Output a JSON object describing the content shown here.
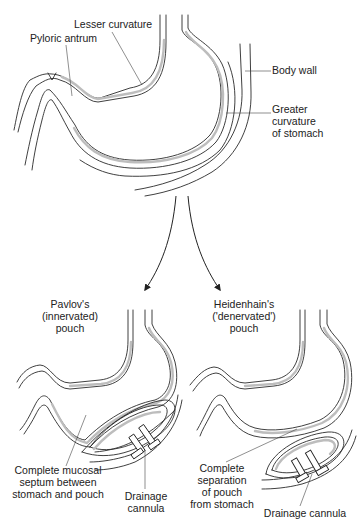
{
  "figure": {
    "top": {
      "labels": {
        "lesser_curvature": "Lesser curvature",
        "pyloric_antrum": "Pyloric antrum",
        "body_wall": "Body wall",
        "greater_curvature": [
          "Greater",
          "curvature",
          "of stomach"
        ]
      }
    },
    "pavlov": {
      "title": [
        "Pavlov's",
        "(innervated)",
        "pouch"
      ],
      "septum_label": [
        "Complete mucosal",
        "septum between",
        "stomach and pouch"
      ],
      "cannula_label": [
        "Drainage",
        "cannula"
      ]
    },
    "heidenhain": {
      "title": [
        "Heidenhain's",
        "('denervated')",
        "pouch"
      ],
      "separation_label": [
        "Complete",
        "separation",
        "of pouch",
        "from stomach"
      ],
      "cannula_label": [
        "Drainage cannula"
      ]
    }
  }
}
